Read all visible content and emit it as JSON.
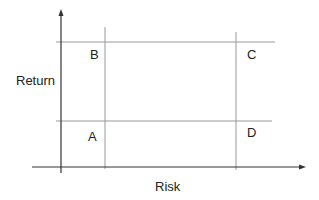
{
  "diagram": {
    "title": "",
    "axes": {
      "x_label": "Risk",
      "y_label": "Return"
    },
    "quadrants": {
      "top_left": "B",
      "top_right": "C",
      "bottom_left": "A",
      "bottom_right": "D"
    },
    "colors": {
      "axis": "#333333",
      "grid": "#999999",
      "text": "#222222"
    }
  }
}
